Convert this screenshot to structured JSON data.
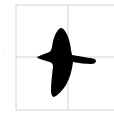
{
  "figure": {
    "background_color": "#ffffff",
    "grid_color": "#c8c8c8",
    "silhouette_color": "#000000"
  }
}
